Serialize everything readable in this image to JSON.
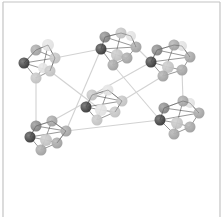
{
  "diagram": {
    "type": "network",
    "width": 224,
    "height": 217,
    "frame": {
      "stroke": "#c4c4c4",
      "top": 2,
      "left": 3,
      "right": 220
    },
    "colors": {
      "background": "#ffffff",
      "edge_inter": "#d2d2d2",
      "edge_intra": "#3a3a3a",
      "node_dark": "#2e2e2e",
      "node_mid": "#7a7a7a",
      "node_gray": "#9a9a9a",
      "node_light": "#bdbdbd",
      "node_pale": "#dedede"
    },
    "clusters": [
      {
        "id": "c1",
        "nodes": [
          {
            "x": 24,
            "y": 63,
            "r": 5.5,
            "shade": "node_dark"
          },
          {
            "x": 36,
            "y": 50,
            "r": 5.5,
            "shade": "node_gray"
          },
          {
            "x": 48,
            "y": 45,
            "r": 6,
            "shade": "node_pale"
          },
          {
            "x": 55,
            "y": 58,
            "r": 5.5,
            "shade": "node_light"
          },
          {
            "x": 50,
            "y": 71,
            "r": 5.5,
            "shade": "node_light"
          },
          {
            "x": 43,
            "y": 68,
            "r": 5,
            "shade": "node_pale"
          },
          {
            "x": 36,
            "y": 78,
            "r": 5.5,
            "shade": "node_light"
          }
        ],
        "edges": [
          [
            0,
            1
          ],
          [
            1,
            2
          ],
          [
            2,
            3
          ],
          [
            3,
            4
          ],
          [
            4,
            6
          ],
          [
            6,
            0
          ],
          [
            0,
            3
          ],
          [
            0,
            4
          ],
          [
            1,
            3
          ],
          [
            2,
            5
          ],
          [
            5,
            6
          ]
        ]
      },
      {
        "id": "c2",
        "nodes": [
          {
            "x": 101,
            "y": 49,
            "r": 5.5,
            "shade": "node_dark"
          },
          {
            "x": 105,
            "y": 37,
            "r": 5.5,
            "shade": "node_mid"
          },
          {
            "x": 121,
            "y": 33,
            "r": 5.5,
            "shade": "node_light"
          },
          {
            "x": 131,
            "y": 36,
            "r": 5,
            "shade": "node_pale"
          },
          {
            "x": 136,
            "y": 47,
            "r": 5.5,
            "shade": "node_gray"
          },
          {
            "x": 127,
            "y": 58,
            "r": 5.5,
            "shade": "node_gray"
          },
          {
            "x": 117,
            "y": 55,
            "r": 6,
            "shade": "node_light"
          },
          {
            "x": 113,
            "y": 65,
            "r": 5.5,
            "shade": "node_gray"
          }
        ],
        "edges": [
          [
            0,
            1
          ],
          [
            1,
            2
          ],
          [
            2,
            3
          ],
          [
            3,
            4
          ],
          [
            4,
            5
          ],
          [
            5,
            7
          ],
          [
            7,
            0
          ],
          [
            0,
            4
          ],
          [
            0,
            6
          ],
          [
            1,
            4
          ],
          [
            2,
            7
          ],
          [
            6,
            5
          ]
        ]
      },
      {
        "id": "c3",
        "nodes": [
          {
            "x": 151,
            "y": 62,
            "r": 5.5,
            "shade": "node_dark"
          },
          {
            "x": 157,
            "y": 50,
            "r": 5.5,
            "shade": "node_mid"
          },
          {
            "x": 174,
            "y": 45,
            "r": 5.5,
            "shade": "node_gray"
          },
          {
            "x": 182,
            "y": 46,
            "r": 5,
            "shade": "node_pale"
          },
          {
            "x": 190,
            "y": 57,
            "r": 5.5,
            "shade": "node_gray"
          },
          {
            "x": 182,
            "y": 70,
            "r": 5.5,
            "shade": "node_gray"
          },
          {
            "x": 168,
            "y": 67,
            "r": 6,
            "shade": "node_light"
          },
          {
            "x": 163,
            "y": 76,
            "r": 5.5,
            "shade": "node_gray"
          }
        ],
        "edges": [
          [
            0,
            1
          ],
          [
            1,
            2
          ],
          [
            2,
            3
          ],
          [
            3,
            4
          ],
          [
            4,
            5
          ],
          [
            5,
            7
          ],
          [
            7,
            0
          ],
          [
            0,
            4
          ],
          [
            0,
            6
          ],
          [
            1,
            4
          ],
          [
            2,
            7
          ],
          [
            6,
            5
          ]
        ]
      },
      {
        "id": "c4",
        "nodes": [
          {
            "x": 86,
            "y": 107,
            "r": 5.5,
            "shade": "node_dark"
          },
          {
            "x": 92,
            "y": 95,
            "r": 5.5,
            "shade": "node_light"
          },
          {
            "x": 108,
            "y": 90,
            "r": 5.5,
            "shade": "node_pale"
          },
          {
            "x": 122,
            "y": 101,
            "r": 5.5,
            "shade": "node_light"
          },
          {
            "x": 115,
            "y": 112,
            "r": 5.5,
            "shade": "node_light"
          },
          {
            "x": 101,
            "y": 110,
            "r": 6,
            "shade": "node_pale"
          },
          {
            "x": 97,
            "y": 120,
            "r": 5.5,
            "shade": "node_light"
          }
        ],
        "edges": [
          [
            0,
            1
          ],
          [
            1,
            2
          ],
          [
            2,
            3
          ],
          [
            3,
            4
          ],
          [
            4,
            6
          ],
          [
            6,
            0
          ],
          [
            0,
            3
          ],
          [
            0,
            5
          ],
          [
            1,
            3
          ],
          [
            2,
            6
          ],
          [
            5,
            4
          ]
        ]
      },
      {
        "id": "c5",
        "nodes": [
          {
            "x": 30,
            "y": 137,
            "r": 5.5,
            "shade": "node_dark"
          },
          {
            "x": 36,
            "y": 126,
            "r": 5.5,
            "shade": "node_mid"
          },
          {
            "x": 52,
            "y": 121,
            "r": 5.5,
            "shade": "node_gray"
          },
          {
            "x": 66,
            "y": 131,
            "r": 5.5,
            "shade": "node_gray"
          },
          {
            "x": 57,
            "y": 143,
            "r": 5.5,
            "shade": "node_gray"
          },
          {
            "x": 46,
            "y": 140,
            "r": 6,
            "shade": "node_light"
          },
          {
            "x": 41,
            "y": 150,
            "r": 5.5,
            "shade": "node_gray"
          }
        ],
        "edges": [
          [
            0,
            1
          ],
          [
            1,
            2
          ],
          [
            2,
            3
          ],
          [
            3,
            4
          ],
          [
            4,
            6
          ],
          [
            6,
            0
          ],
          [
            0,
            3
          ],
          [
            0,
            5
          ],
          [
            1,
            3
          ],
          [
            2,
            6
          ],
          [
            5,
            4
          ]
        ]
      },
      {
        "id": "c6",
        "nodes": [
          {
            "x": 160,
            "y": 120,
            "r": 5.5,
            "shade": "node_dark"
          },
          {
            "x": 164,
            "y": 108,
            "r": 5.5,
            "shade": "node_mid"
          },
          {
            "x": 183,
            "y": 101,
            "r": 5.5,
            "shade": "node_gray"
          },
          {
            "x": 190,
            "y": 103,
            "r": 5,
            "shade": "node_pale"
          },
          {
            "x": 199,
            "y": 113,
            "r": 5.5,
            "shade": "node_gray"
          },
          {
            "x": 190,
            "y": 127,
            "r": 5.5,
            "shade": "node_gray"
          },
          {
            "x": 177,
            "y": 123,
            "r": 6,
            "shade": "node_light"
          },
          {
            "x": 174,
            "y": 134,
            "r": 5.5,
            "shade": "node_gray"
          }
        ],
        "edges": [
          [
            0,
            1
          ],
          [
            1,
            2
          ],
          [
            2,
            3
          ],
          [
            3,
            4
          ],
          [
            4,
            5
          ],
          [
            5,
            7
          ],
          [
            7,
            0
          ],
          [
            0,
            4
          ],
          [
            0,
            6
          ],
          [
            1,
            4
          ],
          [
            2,
            7
          ],
          [
            6,
            5
          ]
        ]
      }
    ],
    "links": [
      {
        "from": [
          55,
          58
        ],
        "to": [
          101,
          49
        ]
      },
      {
        "from": [
          50,
          71
        ],
        "to": [
          101,
          110
        ]
      },
      {
        "from": [
          36,
          78
        ],
        "to": [
          36,
          126
        ]
      },
      {
        "from": [
          101,
          49
        ],
        "to": [
          66,
          131
        ]
      },
      {
        "from": [
          113,
          65
        ],
        "to": [
          160,
          120
        ]
      },
      {
        "from": [
          136,
          47
        ],
        "to": [
          151,
          62
        ]
      },
      {
        "from": [
          122,
          101
        ],
        "to": [
          163,
          76
        ]
      },
      {
        "from": [
          66,
          131
        ],
        "to": [
          160,
          120
        ]
      },
      {
        "from": [
          52,
          121
        ],
        "to": [
          108,
          90
        ]
      },
      {
        "from": [
          92,
          95
        ],
        "to": [
          151,
          62
        ]
      },
      {
        "from": [
          182,
          70
        ],
        "to": [
          183,
          101
        ]
      }
    ]
  }
}
